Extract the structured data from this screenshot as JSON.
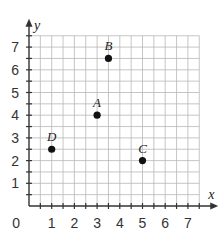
{
  "chart_data": {
    "type": "scatter",
    "title": "",
    "xlabel": "x",
    "ylabel": "y",
    "xlim": [
      0,
      7.5
    ],
    "ylim": [
      0,
      7.5
    ],
    "grid": true,
    "grid_step": 0.5,
    "x_ticks": [
      "1",
      "2",
      "3",
      "4",
      "5",
      "6",
      "7"
    ],
    "y_ticks": [
      "1",
      "2",
      "3",
      "4",
      "5",
      "6",
      "7"
    ],
    "origin_label": "0",
    "points": [
      {
        "label": "A",
        "x": 3,
        "y": 4
      },
      {
        "label": "B",
        "x": 3.5,
        "y": 6.5
      },
      {
        "label": "C",
        "x": 5,
        "y": 2
      },
      {
        "label": "D",
        "x": 1,
        "y": 2.5
      }
    ]
  },
  "colors": {
    "grid": "#b8b8b8",
    "axis": "#333333",
    "point": "#111111"
  }
}
